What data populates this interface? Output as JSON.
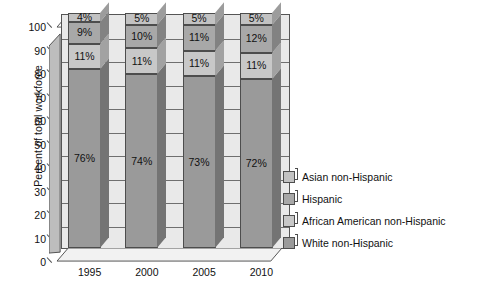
{
  "chart_data": {
    "type": "bar",
    "subtype": "stacked-bar-3d",
    "title": "",
    "xlabel": "",
    "ylabel": "Percent of total workforce",
    "categories": [
      "1995",
      "2000",
      "2005",
      "2010"
    ],
    "ylim": [
      0,
      100
    ],
    "yticks": [
      0,
      10,
      20,
      30,
      40,
      50,
      60,
      70,
      80,
      90,
      100
    ],
    "ytick_labels": [
      "0",
      "10",
      "20",
      "30",
      "40",
      "50",
      "60",
      "70",
      "80",
      "90",
      "100"
    ],
    "grid": true,
    "grid_axis": "y",
    "legend_position": "right",
    "stack_order_bottom_to_top": [
      "White non-Hispanic",
      "African American non-Hispanic",
      "Hispanic",
      "Asian non-Hispanic"
    ],
    "series": [
      {
        "name": "White non-Hispanic",
        "color": "#9a9a9a",
        "values": [
          76,
          74,
          73,
          72
        ],
        "labels": [
          "76%",
          "74%",
          "73%",
          "72%"
        ]
      },
      {
        "name": "African American non-Hispanic",
        "color": "#c8c8c8",
        "values": [
          11,
          11,
          11,
          11
        ],
        "labels": [
          "11%",
          "11%",
          "11%",
          "11%"
        ]
      },
      {
        "name": "Hispanic",
        "color": "#a8a8a8",
        "values": [
          9,
          10,
          11,
          12
        ],
        "labels": [
          "9%",
          "10%",
          "11%",
          "12%"
        ]
      },
      {
        "name": "Asian non-Hispanic",
        "color": "#c2c2c2",
        "values": [
          4,
          5,
          5,
          5
        ],
        "labels": [
          "4%",
          "5%",
          "5%",
          "5%"
        ]
      }
    ],
    "legend_entries": [
      {
        "label": "Asian non-Hispanic",
        "color": "#c2c2c2"
      },
      {
        "label": "Hispanic",
        "color": "#a8a8a8"
      },
      {
        "label": "African American non-Hispanic",
        "color": "#c8c8c8"
      },
      {
        "label": "White non-Hispanic",
        "color": "#9a9a9a"
      }
    ],
    "colors": {
      "plot_background": "#e9e9e9",
      "axis_line": "#4a4a4a",
      "gridline": "#6f6f6f",
      "text": "#111111",
      "page_background": "#ffffff"
    }
  }
}
